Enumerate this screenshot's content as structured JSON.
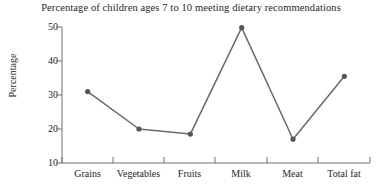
{
  "chart_data": {
    "type": "line",
    "title": "Percentage of children ages 7 to 10 meeting dietary recommendations",
    "xlabel": "",
    "ylabel": "Percentage",
    "categories": [
      "Grains",
      "Vegetables",
      "Fruits",
      "Milk",
      "Meat",
      "Total fat"
    ],
    "values": [
      31,
      20,
      18.5,
      49.8,
      17,
      35.5
    ],
    "ylim": [
      10,
      50
    ],
    "yticks": [
      10,
      20,
      30,
      40,
      50
    ],
    "ytick_labels": [
      "10",
      "20",
      "30",
      "40",
      "50"
    ],
    "grid": false,
    "legend": false,
    "markers": true,
    "line_color": "#6a6a6a",
    "marker_color": "#565656",
    "axis_color": "#6f6f6f",
    "text_color": "#26262a",
    "background": "#ffffff"
  },
  "axis": {
    "y_label": "Percentage",
    "y_ticks": [
      "50",
      "40",
      "30",
      "20",
      "10"
    ],
    "x_ticks": [
      "Grains",
      "Vegetables",
      "Fruits",
      "Milk",
      "Meat",
      "Total fat"
    ]
  },
  "title": "Percentage of children ages 7 to 10 meeting dietary recommendations"
}
